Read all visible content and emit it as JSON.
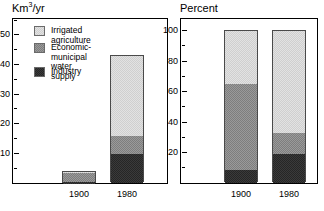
{
  "legend": {
    "items": [
      {
        "label": "Irrigated agriculture",
        "key": "irrigated",
        "color": "#e2e2e2",
        "icon": "legend-swatch-light"
      },
      {
        "label": "Economic-municipal\nwater supply",
        "key": "econ",
        "color": "#9a9a9a",
        "icon": "legend-swatch-medium"
      },
      {
        "label": "Industry",
        "key": "industry",
        "color": "#3a3a3a",
        "icon": "legend-swatch-dark"
      }
    ]
  },
  "chart_data": [
    {
      "type": "bar",
      "subtype": "stacked",
      "title": "Km3/yr",
      "title_display": "Km³/yr",
      "xlabel": "",
      "ylabel": "Km³/yr",
      "ylim": [
        0,
        55
      ],
      "yticks_major": [
        10,
        20,
        30,
        40,
        50
      ],
      "yticks_minor": [
        5,
        15,
        25,
        35,
        45,
        55
      ],
      "ytick_labels": [
        "10",
        "20",
        "30",
        "40",
        "50"
      ],
      "grid": false,
      "legend_position": "inside-top-left",
      "categories": [
        "1900",
        "1980"
      ],
      "series": [
        {
          "name": "Industry",
          "values": [
            0.5,
            10
          ]
        },
        {
          "name": "Economic-municipal water supply",
          "values": [
            3.0,
            6
          ]
        },
        {
          "name": "Irrigated agriculture",
          "values": [
            0.5,
            27
          ]
        }
      ],
      "totals": [
        4,
        43
      ]
    },
    {
      "type": "bar",
      "subtype": "stacked",
      "title": "Percent",
      "title_display": "Percent",
      "xlabel": "",
      "ylabel": "Percent",
      "ylim": [
        0,
        107
      ],
      "yticks_major": [
        20,
        40,
        60,
        80,
        100
      ],
      "yticks_minor": [
        10,
        30,
        50,
        70,
        90
      ],
      "ytick_labels": [
        "20",
        "40",
        "60",
        "80",
        "100"
      ],
      "grid": false,
      "legend_position": "none",
      "categories": [
        "1900",
        "1980"
      ],
      "series": [
        {
          "name": "Industry",
          "values": [
            9,
            19
          ]
        },
        {
          "name": "Economic-municipal water supply",
          "values": [
            56,
            14
          ]
        },
        {
          "name": "Irrigated agriculture",
          "values": [
            35,
            67
          ]
        }
      ],
      "totals": [
        100,
        100
      ]
    }
  ]
}
